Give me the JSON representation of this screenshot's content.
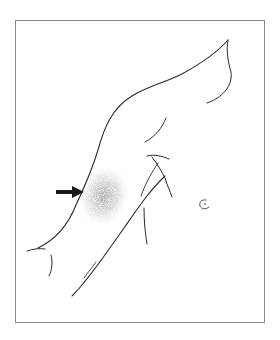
{
  "figure": {
    "description": "Line drawing of a raised arm and upper torso with a stippled shaded patch on the inner upper arm indicated by an arrow",
    "colors": {
      "background": "#ffffff",
      "frame": "#8a8a8a",
      "line": "#2a2a2a",
      "shading": "#9a9a9a",
      "arrow": "#1a1a1a"
    },
    "annotations": [
      {
        "type": "arrow",
        "direction": "right",
        "target": "shaded-lesion"
      }
    ]
  }
}
